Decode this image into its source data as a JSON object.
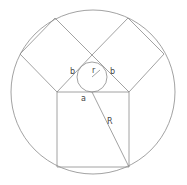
{
  "diagram": {
    "type": "geometry",
    "labels": {
      "a": "a",
      "b_left": "b",
      "b_right": "b",
      "r": "r",
      "R": "R"
    },
    "colors": {
      "stroke": "#8a8a8a",
      "text": "#444444",
      "background": "#ffffff"
    }
  }
}
